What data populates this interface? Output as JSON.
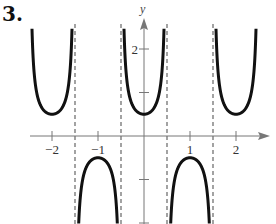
{
  "problem_number": "3.",
  "chart_data": {
    "type": "line",
    "title": "",
    "function": "y = 0.5 sec(pi x)",
    "xlabel": "",
    "ylabel": "y",
    "xlim": [
      -2.5,
      2.6
    ],
    "ylim": [
      -2.0,
      2.5
    ],
    "x_ticks": [
      -2,
      -1,
      1,
      2
    ],
    "x_tick_labels": [
      "-2",
      "-1",
      "1",
      "2"
    ],
    "y_ticks": [
      -2,
      -1,
      1,
      2
    ],
    "y_tick_labels": [
      "2"
    ],
    "asymptotes_x": [
      -1.5,
      -0.5,
      0.5,
      1.5
    ],
    "series": [
      {
        "name": "branch-up-1",
        "x_range": [
          -2.5,
          -1.5
        ],
        "vertex": [
          -2,
          0.5
        ]
      },
      {
        "name": "branch-down-1",
        "x_range": [
          -1.5,
          -0.5
        ],
        "vertex": [
          -1,
          -0.5
        ]
      },
      {
        "name": "branch-up-2",
        "x_range": [
          -0.5,
          0.5
        ],
        "vertex": [
          0,
          0.5
        ]
      },
      {
        "name": "branch-down-2",
        "x_range": [
          0.5,
          1.5
        ],
        "vertex": [
          1,
          -0.5
        ]
      },
      {
        "name": "branch-up-3",
        "x_range": [
          1.5,
          2.5
        ],
        "vertex": [
          2,
          0.5
        ]
      }
    ],
    "grid": false,
    "colors": {
      "curve": "#111111",
      "axis": "#777777",
      "asymptote": "#666666"
    }
  }
}
